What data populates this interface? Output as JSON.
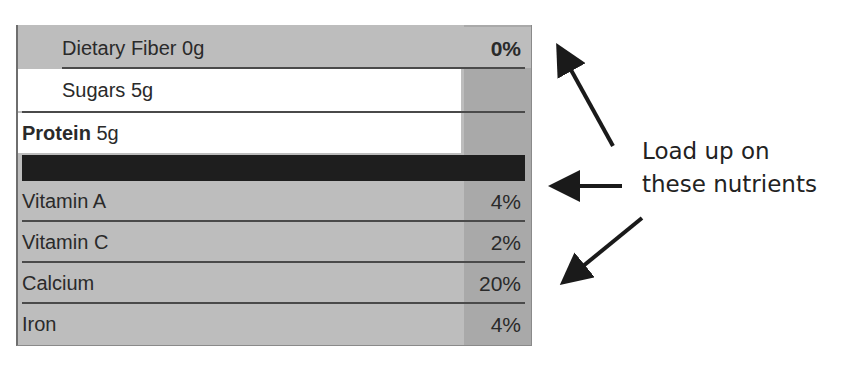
{
  "nutrition_label": {
    "upper_rows": [
      {
        "label": "Dietary Fiber 0g",
        "value": "0%"
      },
      {
        "label": "Sugars 5g",
        "value": ""
      },
      {
        "label_bold": "Protein",
        "label_rest": " 5g",
        "value": ""
      }
    ],
    "vitamin_rows": [
      {
        "label": "Vitamin A",
        "value": "4%"
      },
      {
        "label": "Vitamin C",
        "value": "2%"
      },
      {
        "label": "Calcium",
        "value": "20%"
      },
      {
        "label": "Iron",
        "value": "4%"
      }
    ]
  },
  "annotation": {
    "line1": "Load up on",
    "line2": "these nutrients",
    "arrow_color": "#1a1a1a"
  },
  "colors": {
    "row_gray": "#bdbdbd",
    "pct_column": "#a9a9a9",
    "black_bar": "#1e1e1e"
  }
}
